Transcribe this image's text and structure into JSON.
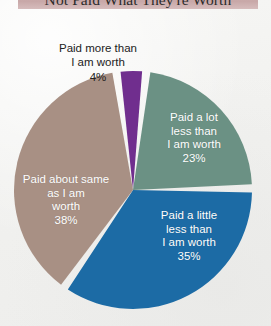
{
  "title": {
    "text": "Not Paid What They're Worth",
    "band_color": "#c8a8a8",
    "text_color": "#2b2b2b"
  },
  "background_color": "#f2f2f0",
  "chart_data": {
    "type": "pie",
    "title": "Not Paid What They're Worth",
    "xlabel": "",
    "ylabel": "",
    "legend_position": "none",
    "grid": false,
    "labels_inside": true,
    "start_angle_deg": -8,
    "direction": "clockwise",
    "categories": [
      "Paid more than I am worth",
      "Paid a lot less than I am worth",
      "Paid a little less than I am worth",
      "Paid about same as I am worth"
    ],
    "values": [
      4,
      23,
      35,
      38
    ],
    "value_labels": [
      "4%",
      "23%",
      "35%",
      "38%"
    ],
    "colors": [
      "#702e8e",
      "#6b9184",
      "#1c6ba5",
      "#a89084"
    ],
    "slices": [
      {
        "name": "paid-more-than",
        "label": "Paid more than\nI am worth",
        "percent": 4,
        "percent_label": "4%",
        "color": "#702e8e",
        "label_placement": "outside",
        "label_color": "#222222"
      },
      {
        "name": "paid-a-lot-less",
        "label": "Paid a lot\nless than\nI am worth",
        "percent": 23,
        "percent_label": "23%",
        "color": "#6b9184",
        "label_placement": "inside",
        "label_color": "#ffffff"
      },
      {
        "name": "paid-a-little-less",
        "label": "Paid a little\nless than\nI am worth",
        "percent": 35,
        "percent_label": "35%",
        "color": "#1c6ba5",
        "label_placement": "inside",
        "label_color": "#ffffff"
      },
      {
        "name": "paid-about-same",
        "label": "Paid about same\nas I am\nworth",
        "percent": 38,
        "percent_label": "38%",
        "color": "#a89084",
        "label_placement": "inside",
        "label_color": "#ffffff"
      }
    ]
  }
}
